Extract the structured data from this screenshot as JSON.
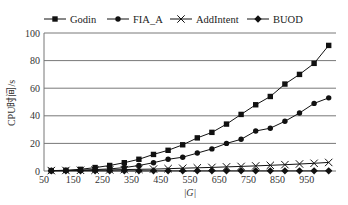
{
  "chart_data": {
    "type": "line",
    "title": "",
    "xlabel": "|G|",
    "ylabel": "CPU时间/s",
    "ylim": [
      0,
      100
    ],
    "yticks": [
      0,
      20,
      40,
      60,
      80,
      100
    ],
    "x": [
      50,
      100,
      150,
      200,
      250,
      300,
      350,
      400,
      450,
      500,
      550,
      600,
      650,
      700,
      750,
      800,
      850,
      900,
      950,
      1000
    ],
    "xtick_labels": [
      "50",
      "150",
      "250",
      "350",
      "450",
      "550",
      "650",
      "750",
      "850",
      "950"
    ],
    "grid": "horizontal",
    "legend_position": "top",
    "series": [
      {
        "name": "Godin",
        "marker": "square",
        "values": [
          0.3,
          0.5,
          1.2,
          2.5,
          4,
          6,
          8.5,
          12,
          15,
          19,
          24,
          28,
          34,
          41,
          48,
          54,
          63,
          70,
          78,
          91
        ]
      },
      {
        "name": "FIA_A",
        "marker": "circle",
        "values": [
          0.2,
          0.3,
          0.6,
          1,
          1.5,
          2.5,
          4,
          6,
          8.5,
          10,
          13,
          16,
          20,
          23,
          29,
          31,
          36,
          42,
          49,
          53
        ]
      },
      {
        "name": "AddIntent",
        "marker": "x",
        "values": [
          0.3,
          0.4,
          0.5,
          0.6,
          0.8,
          1,
          1.2,
          1.4,
          1.7,
          2,
          2.3,
          2.6,
          3,
          3.3,
          3.7,
          4.1,
          4.6,
          5.1,
          5.6,
          6.2
        ]
      },
      {
        "name": "BUOD",
        "marker": "diamond",
        "values": [
          0.1,
          0.1,
          0.1,
          0.1,
          0.1,
          0.1,
          0.1,
          0.1,
          0.1,
          0.1,
          0.1,
          0.1,
          0.1,
          0.1,
          0.1,
          0.1,
          0.1,
          0.1,
          0.1,
          0.1
        ]
      }
    ]
  },
  "legend": {
    "items": [
      {
        "label": "Godin",
        "marker": "square-icon"
      },
      {
        "label": "FIA_A",
        "marker": "circle-icon"
      },
      {
        "label": "AddIntent",
        "marker": "x-icon"
      },
      {
        "label": "BUOD",
        "marker": "diamond-icon"
      }
    ]
  },
  "axes": {
    "x_label": "|G|",
    "y_label": "CPU时间/s"
  },
  "colors": {
    "line": "#111111",
    "grid": "#555555",
    "axis": "#777777"
  }
}
